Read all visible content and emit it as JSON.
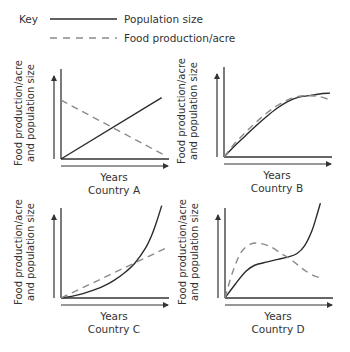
{
  "key": {
    "title": "Key",
    "entries": [
      {
        "label": "Population size",
        "style": "solid"
      },
      {
        "label": "Food production/acre",
        "style": "dashed"
      }
    ]
  },
  "colors": {
    "population": "#2b2b2b",
    "food": "#8a8a8a",
    "axis": "#333333"
  },
  "chart_data": [
    {
      "type": "line",
      "title": "Country A",
      "xlabel": "Years",
      "ylabel": [
        "Food production/acre",
        "and population size"
      ],
      "xlim": [
        0,
        10
      ],
      "ylim": [
        0,
        10
      ],
      "grid": false,
      "ticks": false,
      "series": [
        {
          "name": "Population size",
          "x": [
            0,
            9.5
          ],
          "y": [
            0,
            7.3
          ]
        },
        {
          "name": "Food production/acre",
          "x": [
            0,
            10
          ],
          "y": [
            7.0,
            0.3
          ]
        }
      ]
    },
    {
      "type": "line",
      "title": "Country B",
      "xlabel": "Years",
      "ylabel": [
        "Food production/acre",
        "and population size"
      ],
      "xlim": [
        0,
        10
      ],
      "ylim": [
        0,
        10
      ],
      "grid": false,
      "ticks": false,
      "series": [
        {
          "name": "Population size",
          "x": [
            0,
            1,
            2,
            3,
            4,
            5,
            6,
            7,
            8,
            9,
            10
          ],
          "y": [
            0,
            1.3,
            2.5,
            3.7,
            4.8,
            5.8,
            6.6,
            7.1,
            7.3,
            7.5,
            7.6
          ]
        },
        {
          "name": "Food production/acre",
          "x": [
            0,
            1,
            2,
            3,
            4,
            5,
            6,
            7,
            8,
            9,
            10
          ],
          "y": [
            0,
            1.6,
            2.9,
            4.1,
            5.2,
            6.1,
            6.8,
            7.2,
            7.3,
            7.2,
            6.8
          ]
        }
      ]
    },
    {
      "type": "line",
      "title": "Country C",
      "xlabel": "Years",
      "ylabel": [
        "Food production/acre",
        "and population size"
      ],
      "xlim": [
        0,
        10
      ],
      "ylim": [
        0,
        10
      ],
      "grid": false,
      "ticks": false,
      "series": [
        {
          "name": "Population size",
          "x": [
            0,
            1,
            2,
            3,
            4,
            5,
            6,
            7,
            8,
            8.5,
            9,
            9.5
          ],
          "y": [
            0,
            0.2,
            0.5,
            0.9,
            1.4,
            2.1,
            3.0,
            4.2,
            6.0,
            7.3,
            9.0,
            11.0
          ]
        },
        {
          "name": "Food production/acre",
          "x": [
            0,
            10
          ],
          "y": [
            0,
            6.0
          ]
        }
      ]
    },
    {
      "type": "line",
      "title": "Country D",
      "xlabel": "Years",
      "ylabel": [
        "Food production/acre",
        "and population size"
      ],
      "xlim": [
        0,
        10
      ],
      "ylim": [
        0,
        10
      ],
      "grid": false,
      "ticks": false,
      "series": [
        {
          "name": "Population size",
          "x": [
            0,
            1,
            2,
            2.8,
            4,
            5,
            6,
            6.8,
            7.5,
            8.2,
            8.7,
            9.0
          ],
          "y": [
            0,
            1.7,
            3.2,
            3.9,
            4.3,
            4.6,
            4.9,
            5.3,
            6.2,
            8.0,
            10.0,
            11.3
          ]
        },
        {
          "name": "Food production/acre",
          "x": [
            0,
            0.7,
            1.5,
            2.4,
            3.3,
            4.3,
            5.3,
            6.3,
            7.3,
            8.3,
            9.0
          ],
          "y": [
            0,
            3.0,
            5.4,
            6.4,
            6.5,
            6.1,
            5.3,
            4.5,
            3.5,
            2.7,
            2.4
          ]
        }
      ]
    }
  ]
}
